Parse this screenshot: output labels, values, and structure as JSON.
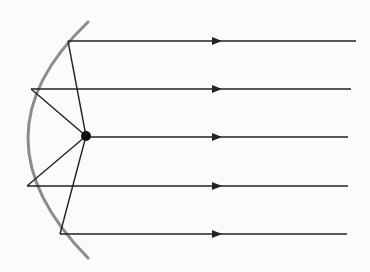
{
  "diagram": {
    "type": "parabolic-mirror-ray-diagram",
    "colors": {
      "mirror": "#8c8c8c",
      "ray": "#222222",
      "focus": "#111111",
      "background": "#fbfbfb"
    },
    "focus": {
      "x": 86,
      "y": 136,
      "r": 5
    },
    "mirror_path": "M 88 22 Q -32 136 88 258",
    "rays": [
      {
        "reflect_x": 68,
        "y": 41,
        "end_x": 356
      },
      {
        "reflect_x": 31,
        "y": 89,
        "end_x": 351
      },
      {
        "reflect_x": 86,
        "y": 137,
        "end_x": 348
      },
      {
        "reflect_x": 27,
        "y": 186,
        "end_x": 348
      },
      {
        "reflect_x": 60,
        "y": 234,
        "end_x": 347
      }
    ],
    "arrow_x": 222
  }
}
